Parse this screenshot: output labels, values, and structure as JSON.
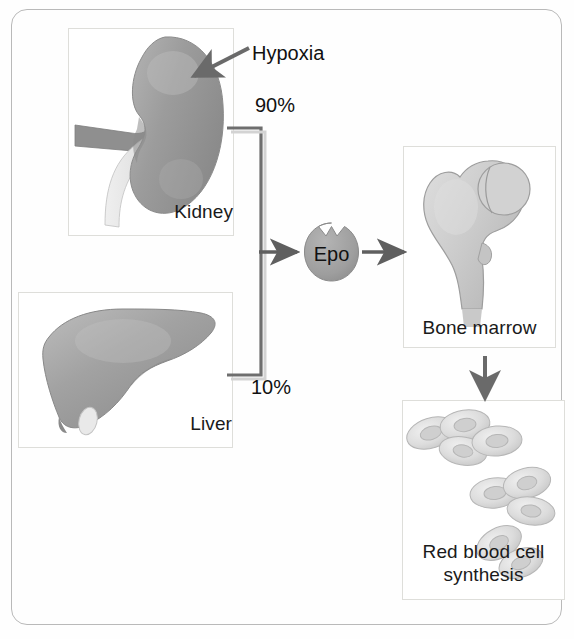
{
  "diagram": {
    "title_visible": false,
    "frame": {
      "border_color": "#b9b9b9"
    },
    "panels": [
      {
        "id": "kidney",
        "label": "Kidney"
      },
      {
        "id": "liver",
        "label": "Liver"
      },
      {
        "id": "bone-marrow",
        "label": "Bone marrow"
      },
      {
        "id": "rbc",
        "label": "Red blood cell\nsynthesis",
        "label_line1": "Red blood cell",
        "label_line2": "synthesis"
      }
    ],
    "annotations": [
      {
        "id": "hypoxia",
        "text": "Hypoxia"
      },
      {
        "id": "percent-top",
        "text": "90%"
      },
      {
        "id": "percent-bot",
        "text": "10%"
      },
      {
        "id": "epo",
        "text": "Epo"
      }
    ],
    "flow": {
      "source_high": "Kidney",
      "source_high_share": "90%",
      "source_low": "Liver",
      "source_low_share": "10%",
      "mediator": "Epo",
      "target": "Bone marrow",
      "outcome": "Red blood cell synthesis"
    },
    "colors": {
      "organ_gray": "#9a9a9a",
      "bone_gray": "#c9c9c9",
      "line_gray": "#6e6e6e",
      "arrow_gray": "#5f5f5f",
      "epo_fill": "#9e9e9e",
      "text": "#111111",
      "panel_shadow": "#cfcfca"
    }
  }
}
